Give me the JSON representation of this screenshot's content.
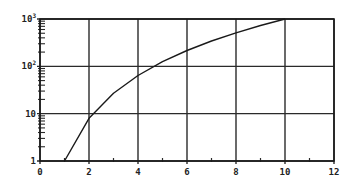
{
  "chart_data": {
    "type": "line",
    "title": "",
    "xlabel": "",
    "ylabel": "",
    "xscale": "linear",
    "yscale": "log",
    "xlim": [
      0,
      12
    ],
    "ylim": [
      1,
      1000
    ],
    "grid": true,
    "legend": null,
    "x_ticks": [
      0,
      2,
      4,
      6,
      8,
      10,
      12
    ],
    "x_tick_labels": [
      "0",
      "2",
      "4",
      "6",
      "8",
      "10",
      "12"
    ],
    "x_minor_ticks": [
      1,
      3,
      5,
      7,
      9,
      11
    ],
    "y_ticks": [
      1,
      10,
      100,
      1000
    ],
    "y_tick_labels": [
      {
        "base": "1",
        "exp": ""
      },
      {
        "base": "10",
        "exp": ""
      },
      {
        "base": "10",
        "exp": "2"
      },
      {
        "base": "10",
        "exp": "3"
      }
    ],
    "series": [
      {
        "name": "y = x^3",
        "x": [
          1,
          2,
          3,
          4,
          5,
          6,
          7,
          8,
          9,
          10
        ],
        "values": [
          1,
          8,
          27,
          64,
          125,
          216,
          343,
          512,
          729,
          1000
        ]
      }
    ]
  },
  "style": {
    "line_color": "#1a1a1a",
    "grid_color": "#2a2a2a",
    "background": "#ffffff"
  }
}
